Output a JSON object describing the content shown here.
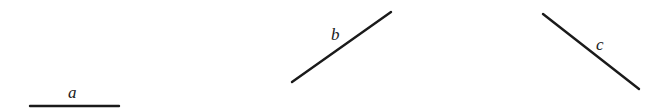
{
  "segments": [
    {
      "id": "a",
      "label": "a",
      "x1": 30,
      "y1": 106,
      "x2": 119,
      "y2": 106,
      "label_x": 68,
      "label_y": 98
    },
    {
      "id": "b",
      "label": "b",
      "x1": 292,
      "y1": 82,
      "x2": 391,
      "y2": 12,
      "label_x": 331,
      "label_y": 40
    },
    {
      "id": "c",
      "label": "c",
      "x1": 543,
      "y1": 14,
      "x2": 639,
      "y2": 89,
      "label_x": 596,
      "label_y": 50
    }
  ],
  "colors": {
    "line": "#1a1a1a",
    "background": "#ffffff"
  }
}
